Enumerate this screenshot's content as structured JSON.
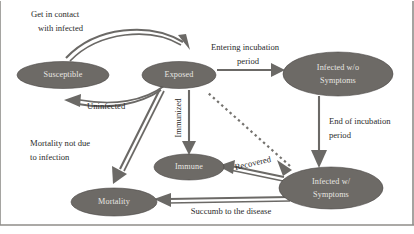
{
  "diagram": {
    "colors": {
      "node_fill": "#6d6a66",
      "node_text": "#e8e6e2",
      "edge": "#6b6966",
      "label_text": "#2b2b2b",
      "background": "#ffffff",
      "frame": "#8f8d89"
    },
    "nodes": [
      {
        "id": "susceptible",
        "label": "Susceptible",
        "lines": [
          "Susceptible"
        ],
        "cx": 63,
        "cy": 75,
        "rx": 46,
        "ry": 13.5
      },
      {
        "id": "exposed",
        "label": "Exposed",
        "lines": [
          "Exposed"
        ],
        "cx": 179,
        "cy": 75,
        "rx": 37,
        "ry": 13.5
      },
      {
        "id": "infected-wo",
        "label": "Infected w/o Symptoms",
        "lines": [
          "Infected w/o",
          "Symptoms"
        ],
        "cx": 338,
        "cy": 74,
        "rx": 55,
        "ry": 22
      },
      {
        "id": "immune",
        "label": "Immune",
        "lines": [
          "Immune"
        ],
        "cx": 189,
        "cy": 167,
        "rx": 35,
        "ry": 13
      },
      {
        "id": "mortality",
        "label": "Mortality",
        "lines": [
          "Mortality"
        ],
        "cx": 114,
        "cy": 202,
        "rx": 43,
        "ry": 14
      },
      {
        "id": "infected-w",
        "label": "Infected w/ Symptoms",
        "lines": [
          "Infected w/",
          "Symptoms"
        ],
        "cx": 331,
        "cy": 188,
        "rx": 52,
        "ry": 21
      }
    ],
    "edges": [
      {
        "id": "susceptible-to-exposed",
        "label": "Get in contact with infected",
        "lines": [
          "Get in contact",
          "with infected"
        ],
        "from": "susceptible",
        "to": "exposed",
        "style": "solid-curved"
      },
      {
        "id": "exposed-to-susceptible",
        "label": "Uninfected",
        "lines": [
          "Uninfected"
        ],
        "from": "exposed",
        "to": "susceptible",
        "style": "solid-curved"
      },
      {
        "id": "exposed-to-infected-wo",
        "label": "Entering incubation period",
        "lines": [
          "Entering incubation",
          "period"
        ],
        "from": "exposed",
        "to": "infected-wo",
        "style": "solid-straight"
      },
      {
        "id": "exposed-to-immune",
        "label": "Immunized",
        "lines": [
          "Immunized"
        ],
        "from": "exposed",
        "to": "immune",
        "style": "solid-vertical",
        "label_rotation": -90
      },
      {
        "id": "exposed-to-mortality",
        "label": "Mortality not due to infection",
        "lines": [
          "Mortality not due",
          "to infection"
        ],
        "from": "exposed",
        "to": "mortality",
        "style": "solid-diagonal"
      },
      {
        "id": "infected-wo-to-infected-w",
        "label": "End of incubation period",
        "lines": [
          "End of incubation",
          "period"
        ],
        "from": "infected-wo",
        "to": "infected-w",
        "style": "solid-vertical"
      },
      {
        "id": "infected-w-to-immune",
        "label": "Recovered",
        "lines": [
          "Recovered"
        ],
        "from": "infected-w",
        "to": "immune",
        "style": "solid-straight",
        "label_rotation": -13
      },
      {
        "id": "infected-w-to-mortality",
        "label": "Succumb to the disease",
        "lines": [
          "Succumb to the disease"
        ],
        "from": "infected-w",
        "to": "mortality",
        "style": "solid-straight"
      },
      {
        "id": "infected-w-to-exposed",
        "label": "",
        "lines": [],
        "from": "infected-w",
        "to": "exposed",
        "style": "dashed"
      }
    ]
  }
}
